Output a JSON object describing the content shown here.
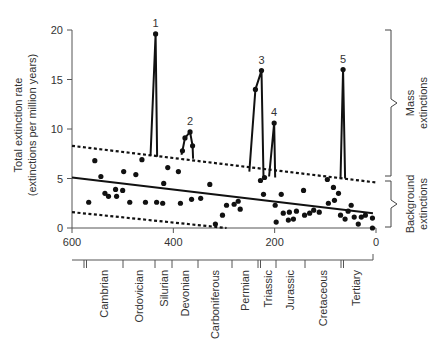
{
  "chart_data": {
    "type": "scatter",
    "title": "",
    "xlabel": "Millions of years ago",
    "ylabel": "Total extinction rate",
    "ylabel_sub": "(extinctions per million years)",
    "xlim": [
      600,
      0
    ],
    "ylim": [
      0,
      20
    ],
    "x_ticks": [
      600,
      400,
      200,
      0
    ],
    "y_ticks": [
      0,
      5,
      10,
      15,
      20
    ],
    "grid": false,
    "background_points": [
      [
        567,
        2.6
      ],
      [
        555,
        6.8
      ],
      [
        543,
        5.2
      ],
      [
        535,
        3.5
      ],
      [
        528,
        3.2
      ],
      [
        514,
        3.9
      ],
      [
        512,
        3.2
      ],
      [
        500,
        3.8
      ],
      [
        498,
        5.7
      ],
      [
        486,
        2.6
      ],
      [
        474,
        5.4
      ],
      [
        462,
        6.9
      ],
      [
        455,
        2.6
      ],
      [
        433,
        2.6
      ],
      [
        421,
        2.5
      ],
      [
        419,
        4.5
      ],
      [
        411,
        6.1
      ],
      [
        390,
        5.7
      ],
      [
        386,
        2.5
      ],
      [
        364,
        2.9
      ],
      [
        346,
        3.0
      ],
      [
        328,
        4.4
      ],
      [
        317,
        0.4
      ],
      [
        303,
        1.3
      ],
      [
        295,
        2.3
      ],
      [
        280,
        2.4
      ],
      [
        272,
        2.7
      ],
      [
        268,
        1.9
      ],
      [
        228,
        4.8
      ],
      [
        220,
        5.1
      ],
      [
        222,
        3.4
      ],
      [
        199,
        2.3
      ],
      [
        197,
        0.6
      ],
      [
        187,
        3.4
      ],
      [
        183,
        1.5
      ],
      [
        173,
        0.8
      ],
      [
        171,
        1.6
      ],
      [
        163,
        0.9
      ],
      [
        157,
        1.7
      ],
      [
        143,
        3.8
      ],
      [
        141,
        1.3
      ],
      [
        131,
        1.5
      ],
      [
        123,
        1.8
      ],
      [
        112,
        1.6
      ],
      [
        96,
        4.9
      ],
      [
        94,
        2.5
      ],
      [
        84,
        4.1
      ],
      [
        82,
        2.8
      ],
      [
        74,
        3.5
      ],
      [
        70,
        1.3
      ],
      [
        61,
        0.9
      ],
      [
        55,
        1.7
      ],
      [
        49,
        2.3
      ],
      [
        43,
        1.1
      ],
      [
        35,
        0.4
      ],
      [
        29,
        1.1
      ],
      [
        21,
        1.3
      ],
      [
        7,
        1.0
      ],
      [
        7,
        0.0
      ]
    ],
    "mass_extinctions": [
      {
        "label": "1",
        "base_left": [
          445,
          7.3
        ],
        "peak": [
          435,
          19.6
        ],
        "base_right": [
          432,
          7.2
        ]
      },
      {
        "label": "2",
        "base_left": [
          384,
          7.4
        ],
        "points": [
          [
            382,
            7.8
          ],
          [
            377,
            9.1
          ],
          [
            367,
            9.7
          ],
          [
            362,
            8.3
          ]
        ],
        "base_right": [
          361,
          7.0
        ]
      },
      {
        "label": "3",
        "base_left": [
          250,
          5.7
        ],
        "points": [
          [
            238,
            14.0
          ]
        ],
        "peak": [
          226,
          15.9
        ],
        "base_right": [
          222,
          5.1
        ]
      },
      {
        "label": "4",
        "base_left": [
          211,
          5.2
        ],
        "peak": [
          201,
          10.6
        ],
        "base_right": [
          199,
          5.1
        ]
      },
      {
        "label": "5",
        "base_left": [
          70,
          5.0
        ],
        "peak": [
          65,
          16.0
        ],
        "base_right": [
          61,
          5.0
        ]
      }
    ],
    "trend_line": [
      [
        600,
        5.1
      ],
      [
        6,
        1.5
      ]
    ],
    "upper_bound": [
      [
        600,
        8.3
      ],
      [
        0,
        4.6
      ]
    ],
    "lower_bound": [
      [
        600,
        1.6
      ],
      [
        295,
        0.0
      ]
    ],
    "annotations": {
      "mass_extinctions": [
        "Mass",
        "extinctions"
      ],
      "background_extinctions": [
        "Background",
        "extinctions"
      ]
    },
    "periods": [
      "Cambrian",
      "Ordovician",
      "Silurian",
      "Devonian",
      "Carboniferous",
      "Permian",
      "Triassic",
      "Jurassic",
      "Cretaceous",
      "Tertiary"
    ]
  }
}
